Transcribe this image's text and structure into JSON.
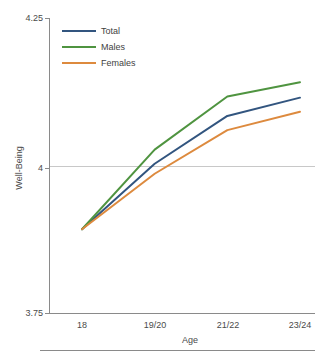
{
  "chart_data": {
    "type": "line",
    "title": "",
    "xlabel": "Age",
    "ylabel": "Well-Being",
    "categories": [
      "18",
      "19/20",
      "21/22",
      "23/24"
    ],
    "ylim": [
      3.75,
      4.25
    ],
    "yticks": [
      "3.75",
      "4",
      "4.25"
    ],
    "ytick_values": [
      3.75,
      4,
      4.25
    ],
    "grid": "horizontal-at-4-only",
    "legend_position": "top-left-inside",
    "series": [
      {
        "name": "Total",
        "color": "#32557f",
        "values": [
          3.892,
          4.003,
          4.084,
          4.115
        ]
      },
      {
        "name": "Males",
        "color": "#4f9440",
        "values": [
          3.892,
          4.027,
          4.117,
          4.141
        ]
      },
      {
        "name": "Females",
        "color": "#dd8a3e",
        "values": [
          3.892,
          3.986,
          4.06,
          4.091
        ]
      }
    ]
  },
  "axes": {
    "y_tick_top": "4.25",
    "y_tick_mid": "4",
    "y_tick_bottom": "3.75",
    "y_axis_title": "Well-Being",
    "x_axis_title": "Age",
    "x_tick_1": "18",
    "x_tick_2": "19/20",
    "x_tick_3": "21/22",
    "x_tick_4": "23/24"
  },
  "legend": {
    "entries": [
      {
        "label": "Total",
        "color": "#32557f"
      },
      {
        "label": "Males",
        "color": "#4f9440"
      },
      {
        "label": "Females",
        "color": "#dd8a3e"
      }
    ]
  },
  "colors": {
    "total": "#32557f",
    "males": "#4f9440",
    "females": "#dd8a3e",
    "axis": "#8a8a8a",
    "grid": "#c8c8c8",
    "text": "#4a4a4a",
    "background": "#ffffff"
  }
}
